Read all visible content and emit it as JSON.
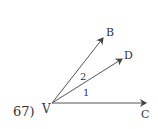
{
  "problem": {
    "number_label": "67)"
  },
  "diagram": {
    "vertex": {
      "label": "V",
      "x": 52,
      "y": 103
    },
    "rays": [
      {
        "id": "B",
        "label": "B",
        "end": [
          103,
          38
        ],
        "label_pos": [
          106,
          36
        ]
      },
      {
        "id": "D",
        "label": "D",
        "end": [
          122,
          59
        ],
        "label_pos": [
          124,
          58
        ]
      },
      {
        "id": "C",
        "label": "C",
        "end": [
          146,
          103
        ],
        "label_pos": [
          142,
          118
        ]
      }
    ],
    "angles": [
      {
        "label": "2",
        "between": [
          "B",
          "D"
        ],
        "pos": [
          80,
          78
        ]
      },
      {
        "label": "1",
        "between": [
          "D",
          "C"
        ],
        "pos": [
          83,
          95
        ]
      }
    ],
    "stroke_color": "#444444"
  }
}
